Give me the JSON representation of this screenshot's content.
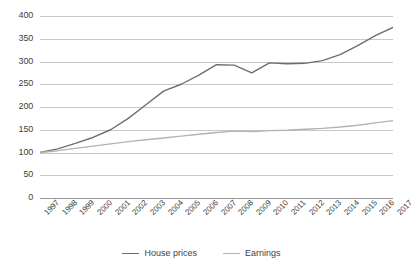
{
  "chart_data": {
    "type": "line",
    "title": "",
    "subtitle": "",
    "xlabel": "",
    "ylabel": "",
    "ylim": [
      0,
      400
    ],
    "yticks": [
      0,
      50,
      100,
      150,
      200,
      250,
      300,
      350,
      400
    ],
    "grid": true,
    "legend_position": "bottom",
    "categories": [
      "1997",
      "1998",
      "1999",
      "2000",
      "2001",
      "2002",
      "2003",
      "2004",
      "2005",
      "2006",
      "2007",
      "2008",
      "2009",
      "2010",
      "2011",
      "2012",
      "2013",
      "2014",
      "2015",
      "2016",
      "2017"
    ],
    "series": [
      {
        "name": "House prices",
        "color": "#6e6e6e",
        "values": [
          100,
          108,
          120,
          133,
          150,
          175,
          205,
          235,
          250,
          270,
          293,
          292,
          275,
          297,
          295,
          296,
          302,
          315,
          335,
          357,
          375
        ]
      },
      {
        "name": "Earnings",
        "color": "#b3b3b3",
        "values": [
          100,
          104,
          109,
          114,
          119,
          124,
          128,
          132,
          136,
          140,
          144,
          147,
          146,
          148,
          149,
          151,
          153,
          156,
          160,
          165,
          170
        ]
      }
    ]
  },
  "legend": {
    "items": [
      {
        "label": "House prices",
        "color": "#6e6e6e"
      },
      {
        "label": "Earnings",
        "color": "#b3b3b3"
      }
    ]
  },
  "colors": {
    "house_prices": "#6e6e6e",
    "earnings": "#b3b3b3",
    "gridline": "#c8c8c8",
    "axis": "#9a9a9a",
    "text": "#3f3f3f",
    "background": "#ffffff"
  }
}
